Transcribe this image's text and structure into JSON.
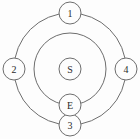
{
  "diagram": {
    "type": "concentric-orbit-node-diagram",
    "background_color": "#fdfdfd",
    "stroke_color": "#6e6e6e",
    "label_color": "#2b2b2b",
    "rings": [
      {
        "name": "outer-ring",
        "cx": 70,
        "cy": 69,
        "r": 56
      },
      {
        "name": "inner-ring",
        "cx": 70,
        "cy": 69,
        "r": 36
      }
    ],
    "nodes": [
      {
        "id": "node-1",
        "label": "1",
        "cx": 70,
        "cy": 13,
        "r": 11,
        "on_ring": "outer-ring",
        "position": "top"
      },
      {
        "id": "node-2",
        "label": "2",
        "cx": 14,
        "cy": 69,
        "r": 11,
        "on_ring": "outer-ring",
        "position": "left"
      },
      {
        "id": "node-3",
        "label": "3",
        "cx": 70,
        "cy": 125,
        "r": 11,
        "on_ring": "outer-ring",
        "position": "bottom"
      },
      {
        "id": "node-4",
        "label": "4",
        "cx": 126,
        "cy": 69,
        "r": 11,
        "on_ring": "outer-ring",
        "position": "right"
      },
      {
        "id": "node-e",
        "label": "E",
        "cx": 70,
        "cy": 105,
        "r": 11,
        "on_ring": "inner-ring",
        "position": "bottom"
      },
      {
        "id": "node-s",
        "label": "S",
        "cx": 70,
        "cy": 69,
        "r": 11,
        "on_ring": "center",
        "position": "center"
      }
    ]
  }
}
